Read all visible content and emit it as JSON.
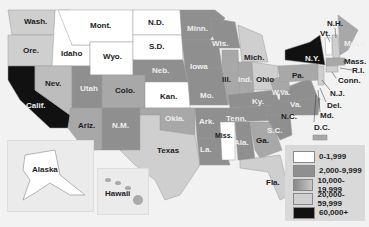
{
  "map": {
    "type": "choropleth",
    "region": "United States"
  },
  "legend": {
    "items": [
      {
        "label": "0-1,999",
        "color": "#ffffff"
      },
      {
        "label": "2,000-9,999",
        "color": "#8f8f8f"
      },
      {
        "label": "10,000-19,999",
        "color": "#a8a8a8"
      },
      {
        "label": "20,000-59,999",
        "color": "#cfcfcf"
      },
      {
        "label": "60,000+",
        "color": "#111111"
      }
    ]
  },
  "states": {
    "wash": "Wash.",
    "ore": "Ore.",
    "calif": "Calif.",
    "idaho": "Idaho",
    "nev": "Nev.",
    "mont": "Mont.",
    "wyo": "Wyo.",
    "utah": "Utah",
    "ariz": "Ariz.",
    "colo": "Colo.",
    "nm": "N.M.",
    "nd": "N.D.",
    "sd": "S.D.",
    "neb": "Neb.",
    "kan": "Kan.",
    "okla": "Okla.",
    "texas": "Texas",
    "minn": "Minn.",
    "iowa": "Iowa",
    "mo": "Mo.",
    "ark": "Ark.",
    "la": "La.",
    "wis": "Wis.",
    "ill": "Ill.",
    "mich": "Mich.",
    "ind": "Ind.",
    "ohio": "Ohio",
    "ky": "Ky.",
    "tenn": "Tenn.",
    "miss": "Miss.",
    "ala": "Ala.",
    "ga": "Ga.",
    "fla": "Fla.",
    "sc": "S.C.",
    "nc": "N.C.",
    "va": "Va.",
    "wva": "W.Va.",
    "pa": "Pa.",
    "ny": "N.Y.",
    "vt": "Vt.",
    "nh": "N.H.",
    "maine": "Maine",
    "mass": "Mass.",
    "ri": "R.I.",
    "conn": "Conn.",
    "nj": "N.J.",
    "del": "Del.",
    "md": "Md.",
    "dc": "D.C.",
    "alaska": "Alaska",
    "hawaii": "Hawaii"
  }
}
